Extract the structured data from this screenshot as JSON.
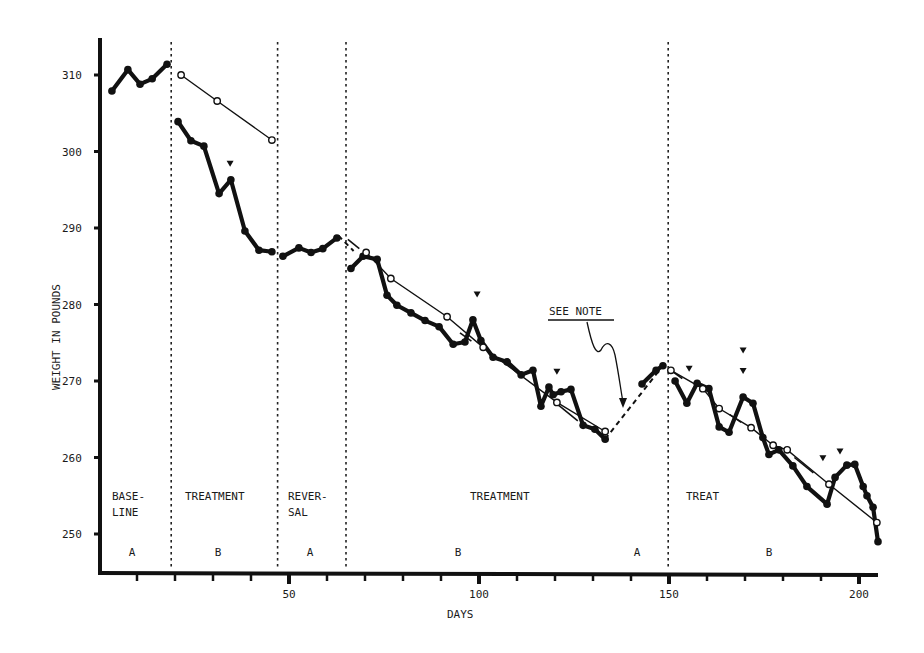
{
  "chart_data": {
    "type": "line",
    "title": "",
    "xlabel": "DAYS",
    "ylabel": "WEIGHT IN POUNDS",
    "xlim": [
      0,
      205
    ],
    "ylim": [
      245,
      314
    ],
    "x_ticks": [
      10,
      20,
      30,
      40,
      50,
      60,
      70,
      80,
      90,
      100,
      110,
      120,
      130,
      140,
      150,
      160,
      170,
      180,
      190,
      200
    ],
    "x_tick_labels": {
      "50": "50",
      "100": "100",
      "150": "150",
      "200": "200"
    },
    "y_ticks": [
      250,
      260,
      270,
      280,
      290,
      300,
      310
    ],
    "y_tick_labels": [
      "250",
      "260",
      "270",
      "280",
      "290",
      "300",
      "310"
    ],
    "grid": false,
    "phase_lines": [
      19,
      47,
      65,
      149
    ],
    "phases": [
      {
        "label": "BASE-\nLINE",
        "line1": "BASE-",
        "line2": "LINE",
        "code": "A",
        "x_start": 0,
        "x_end": 19
      },
      {
        "label": "TREATMENT",
        "line1": "TREATMENT",
        "line2": "",
        "code": "B",
        "x_start": 19,
        "x_end": 47
      },
      {
        "label": "REVER-\nSAL",
        "line1": "REVER-",
        "line2": "SAL",
        "code": "A",
        "x_start": 47,
        "x_end": 65
      },
      {
        "label": "TREATMENT",
        "line1": "TREATMENT",
        "line2": "",
        "code": "B",
        "x_start": 65,
        "x_end": 149
      },
      {
        "label": "",
        "line1": "",
        "line2": "",
        "code": "A",
        "x_start": 134,
        "x_end": 149
      },
      {
        "label": "TREAT",
        "line1": "TREAT",
        "line2": "",
        "code": "B",
        "x_start": 149,
        "x_end": 205
      }
    ],
    "series": [
      {
        "name": "Daily weight (baseline)",
        "style": "solid-thick-filled-dots",
        "x": [
          3.4,
          7.6,
          10.8,
          14.0,
          17.9
        ],
        "y": [
          307.9,
          310.7,
          308.8,
          309.5,
          311.4
        ]
      },
      {
        "name": "Daily weight (treatment 1)",
        "style": "solid-thick-filled-dots",
        "x": [
          20.8,
          24.2,
          27.6,
          31.6,
          34.7,
          38.4,
          42.1,
          45.5
        ],
        "y": [
          303.9,
          301.4,
          300.7,
          294.5,
          296.3,
          289.6,
          287.1,
          286.9
        ]
      },
      {
        "name": "Daily weight (reversal)",
        "style": "solid-thick-filled-dots",
        "x": [
          48.4,
          52.6,
          55.8,
          58.9,
          62.6
        ],
        "y": [
          286.3,
          287.4,
          286.8,
          287.3,
          288.7
        ]
      },
      {
        "name": "Daily weight (treatment 2)",
        "style": "solid-thick-filled-dots",
        "x": [
          66.3,
          69.5,
          73.2,
          75.8,
          78.4,
          82.1,
          85.8,
          89.5,
          93.2,
          96.3,
          98.4,
          100.5,
          103.7,
          107.4,
          111.1,
          114.2,
          116.3,
          118.4,
          119.5,
          121.6,
          124.2,
          127.4,
          130.5,
          133.2
        ],
        "y": [
          284.7,
          286.3,
          285.9,
          281.2,
          279.9,
          278.9,
          277.9,
          277.1,
          274.8,
          275.1,
          278.0,
          275.3,
          273.1,
          272.5,
          270.8,
          271.4,
          266.7,
          269.2,
          268.2,
          268.6,
          268.9,
          264.2,
          263.7,
          262.4
        ]
      },
      {
        "name": "Daily weight (A return)",
        "style": "solid-thick-filled-dots",
        "x": [
          142.9,
          146.6,
          148.4
        ],
        "y": [
          269.6,
          271.4,
          272.0
        ]
      },
      {
        "name": "Daily weight (treatment 3)",
        "style": "solid-thick-filled-dots",
        "x": [
          151.6,
          154.7,
          157.4,
          160.5,
          163.2,
          165.8,
          169.5,
          172.1,
          174.7,
          176.3,
          178.9,
          182.6,
          186.3,
          191.6,
          193.7,
          196.8,
          198.9,
          201.1,
          202.1,
          203.7,
          205.0
        ],
        "y": [
          270.0,
          267.1,
          269.7,
          269.0,
          264.0,
          263.3,
          267.9,
          267.1,
          262.6,
          260.4,
          261.0,
          258.9,
          256.2,
          253.9,
          257.4,
          259.0,
          259.1,
          256.2,
          255.0,
          253.5,
          249.0
        ]
      },
      {
        "name": "Trend (open circles, treatment 1)",
        "style": "thin-open-circles",
        "x": [
          21.6,
          31.1,
          45.5
        ],
        "y": [
          310.0,
          306.6,
          301.5
        ]
      },
      {
        "name": "Trend (open circles, treatment 2)",
        "style": "thin-open-circles",
        "x": [
          70.3,
          76.8,
          91.6,
          101.1,
          120.5,
          133.2
        ],
        "y": [
          286.8,
          283.4,
          278.4,
          274.4,
          267.2,
          263.4
        ]
      },
      {
        "name": "Trend (open circles, treatment 3)",
        "style": "thin-open-circles",
        "x": [
          150.5,
          158.9,
          163.2,
          171.6,
          177.4,
          181.1,
          192.1,
          204.7
        ],
        "y": [
          271.4,
          269.0,
          266.4,
          263.9,
          261.6,
          261.0,
          256.5,
          251.5
        ]
      }
    ],
    "dashed_connectors": [
      {
        "x": [
          63.0,
          67.0
        ],
        "y": [
          289.0,
          287.0
        ]
      },
      {
        "x": [
          133.2,
          148.4
        ],
        "y": [
          262.4,
          272.0
        ]
      }
    ],
    "markers_triangles": [
      {
        "x": 34.5,
        "y": 298.4
      },
      {
        "x": 99.5,
        "y": 281.3
      },
      {
        "x": 120.5,
        "y": 271.2
      },
      {
        "x": 155.3,
        "y": 271.6
      },
      {
        "x": 169.5,
        "y": 274.0
      },
      {
        "x": 169.5,
        "y": 271.3
      },
      {
        "x": 190.5,
        "y": 259.9
      },
      {
        "x": 195.0,
        "y": 260.8
      }
    ],
    "annotations": [
      {
        "text": "SEE NOTE",
        "x": 117,
        "y": 280.5,
        "arrow_to": {
          "x": 139.0,
          "y": 266.0
        }
      }
    ]
  }
}
